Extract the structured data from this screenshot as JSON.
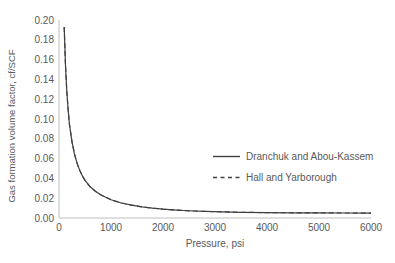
{
  "colors": {
    "line": "#404040",
    "axis": "#bfbfbf",
    "text": "#595959",
    "background": "#ffffff"
  },
  "chart_data": {
    "type": "line",
    "title": "",
    "xlabel": "Pressure, psi",
    "ylabel": "Gas formation volume factor, cf/SCF",
    "xlim": [
      0,
      6000
    ],
    "ylim": [
      0,
      0.2
    ],
    "grid": false,
    "legend_position": "center-right",
    "xtick_values": [
      0,
      1000,
      2000,
      3000,
      4000,
      5000,
      6000
    ],
    "xtick_labels": [
      "0",
      "1000",
      "2000",
      "3000",
      "4000",
      "5000",
      "6000"
    ],
    "ytick_values": [
      0,
      0.02,
      0.04,
      0.06,
      0.08,
      0.1,
      0.12,
      0.14,
      0.16,
      0.18,
      0.2
    ],
    "ytick_labels": [
      "0.00",
      "0.02",
      "0.04",
      "0.06",
      "0.08",
      "0.10",
      "0.12",
      "0.14",
      "0.16",
      "0.18",
      "0.20"
    ],
    "x": [
      100,
      125,
      150,
      175,
      200,
      250,
      300,
      350,
      400,
      450,
      500,
      600,
      700,
      800,
      900,
      1000,
      1200,
      1400,
      1600,
      1800,
      2000,
      2200,
      2400,
      2600,
      2800,
      3000,
      3500,
      4000,
      4500,
      5000,
      5500,
      6000
    ],
    "series": [
      {
        "name": "Dranchuk and Abou-Kassem",
        "line_style": "solid",
        "values": [
          0.193,
          0.154,
          0.128,
          0.11,
          0.095,
          0.077,
          0.064,
          0.055,
          0.048,
          0.0425,
          0.038,
          0.0315,
          0.027,
          0.0235,
          0.021,
          0.0185,
          0.0152,
          0.0129,
          0.0112,
          0.0099,
          0.0089,
          0.0082,
          0.0076,
          0.0071,
          0.0067,
          0.0064,
          0.0058,
          0.0055,
          0.0053,
          0.0052,
          0.0051,
          0.005
        ]
      },
      {
        "name": "Hall and Yarborough",
        "line_style": "dashed",
        "values": [
          0.193,
          0.154,
          0.128,
          0.11,
          0.095,
          0.077,
          0.064,
          0.055,
          0.048,
          0.0425,
          0.038,
          0.0315,
          0.027,
          0.0235,
          0.021,
          0.0185,
          0.0152,
          0.0129,
          0.0112,
          0.0099,
          0.0089,
          0.0082,
          0.0076,
          0.0071,
          0.0067,
          0.0064,
          0.0058,
          0.0055,
          0.0053,
          0.0052,
          0.0051,
          0.005
        ]
      }
    ]
  }
}
